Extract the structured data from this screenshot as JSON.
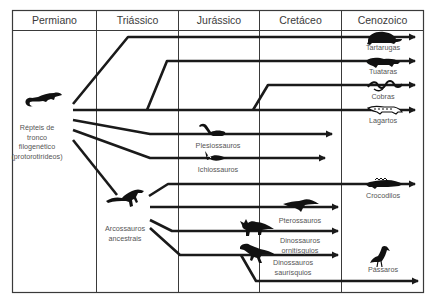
{
  "periods": [
    {
      "label": "Permiano"
    },
    {
      "label": "Triássico"
    },
    {
      "label": "Jurássico"
    },
    {
      "label": "Cretáceo"
    },
    {
      "label": "Cenozoico"
    }
  ],
  "root": {
    "label_line1": "Répteis de",
    "label_line2": "tronco",
    "label_line3": "filogenético",
    "label_line4": "(protorotirídeos)",
    "icon": "lizard-silhouette-icon"
  },
  "archosaurs": {
    "label_line1": "Arcossauros",
    "label_line2": "ancestrais",
    "icon": "archosaur-silhouette-icon"
  },
  "lineages": [
    {
      "label": "Tartarugas",
      "icon": "turtle-silhouette-icon"
    },
    {
      "label": "Tuataras",
      "icon": "tuatara-silhouette-icon"
    },
    {
      "label": "Cobras",
      "icon": "snake-silhouette-icon"
    },
    {
      "label": "Lagartos",
      "icon": "lizard-silhouette-icon"
    },
    {
      "label": "Plesiossauros",
      "icon": "plesiosaur-silhouette-icon"
    },
    {
      "label": "Ichiossauros",
      "icon": "ichthyosaur-silhouette-icon"
    },
    {
      "label": "Crocodilos",
      "icon": "crocodile-silhouette-icon"
    },
    {
      "label": "Pterossauros",
      "icon": "pterosaur-silhouette-icon"
    },
    {
      "label": "Dinossauros",
      "label2": "ornitísquios",
      "icon": "triceratops-silhouette-icon"
    },
    {
      "label": "Dinossauros",
      "label2": "saurísquios",
      "icon": "theropod-silhouette-icon"
    },
    {
      "label": "Pássaros",
      "icon": "bird-silhouette-icon"
    }
  ],
  "colors": {
    "line": "#1a1a1a",
    "grid": "#3a3a3a",
    "text": "#555555"
  }
}
